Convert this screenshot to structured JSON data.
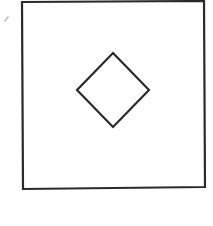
{
  "canvas": {
    "width": 213,
    "height": 226,
    "background": "#ffffff"
  },
  "diagram": {
    "outer_square": {
      "points": [
        [
          22,
          2
        ],
        [
          204,
          1
        ],
        [
          205,
          187
        ],
        [
          23,
          189
        ]
      ],
      "stroke": "#2a2a2a",
      "stroke_width": 2.2,
      "fill": "none"
    },
    "inner_diamond": {
      "points": [
        [
          113,
          53
        ],
        [
          149,
          90
        ],
        [
          113,
          127
        ],
        [
          77,
          90
        ]
      ],
      "stroke": "#2a2a2a",
      "stroke_width": 2.2,
      "fill": "none"
    },
    "smudge_mark": {
      "x1": 5,
      "y1": 21,
      "x2": 8,
      "y2": 17,
      "stroke": "#c8c8c8",
      "stroke_width": 2
    }
  }
}
